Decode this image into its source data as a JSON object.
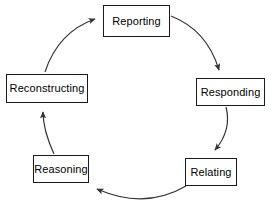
{
  "diagram": {
    "type": "cycle",
    "direction": "clockwise",
    "background_color": "#ffffff",
    "line_color": "#333333",
    "box_border_color": "#1a1a1a",
    "box_fill_color": "#ffffff",
    "text_color": "#000000",
    "nodes": [
      {
        "id": "reporting",
        "label": "Reporting"
      },
      {
        "id": "responding",
        "label": "Responding"
      },
      {
        "id": "relating",
        "label": "Relating"
      },
      {
        "id": "reasoning",
        "label": "Reasoning"
      },
      {
        "id": "reconstructing",
        "label": "Reconstructing"
      }
    ],
    "edges": [
      {
        "from": "reporting",
        "to": "responding",
        "style": "curved-arrow"
      },
      {
        "from": "responding",
        "to": "relating",
        "style": "curved-arrow"
      },
      {
        "from": "relating",
        "to": "reasoning",
        "style": "curved-arrow"
      },
      {
        "from": "reasoning",
        "to": "reconstructing",
        "style": "curved-arrow"
      },
      {
        "from": "reconstructing",
        "to": "reporting",
        "style": "curved-arrow"
      }
    ]
  }
}
